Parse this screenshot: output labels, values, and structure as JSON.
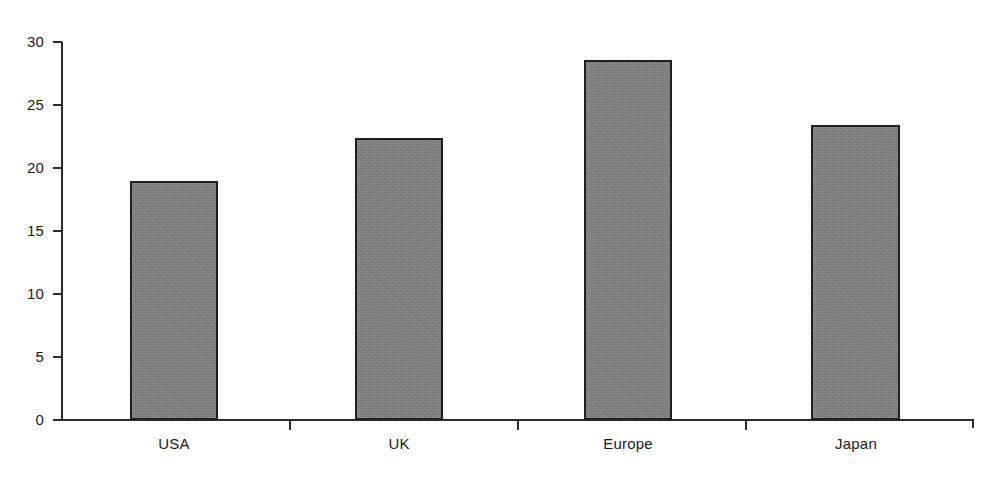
{
  "chart_data": {
    "type": "bar",
    "title": "",
    "subtitle": "",
    "xlabel": "",
    "ylabel": "",
    "categories": [
      "USA",
      "UK",
      "Europe",
      "Japan"
    ],
    "values": [
      19.0,
      22.4,
      28.6,
      23.4
    ],
    "ylim": [
      0,
      30
    ],
    "ytick_labels": [
      "0",
      "5",
      "10",
      "15",
      "20",
      "25",
      "30"
    ],
    "ytick_values": [
      0,
      5,
      10,
      15,
      20,
      25,
      30
    ],
    "grid": false,
    "legend": null,
    "legend_position": "none",
    "annotations": [],
    "series": [
      {
        "name": "",
        "values": [
          19.0,
          22.4,
          28.6,
          23.4
        ]
      }
    ]
  },
  "style": {
    "bar_fill_color": "#828282",
    "bar_border_color": "#1f1f1f",
    "axis_color": "#2b2b2b",
    "text_color": "#1a1a1a",
    "background_color": "#ffffff"
  }
}
